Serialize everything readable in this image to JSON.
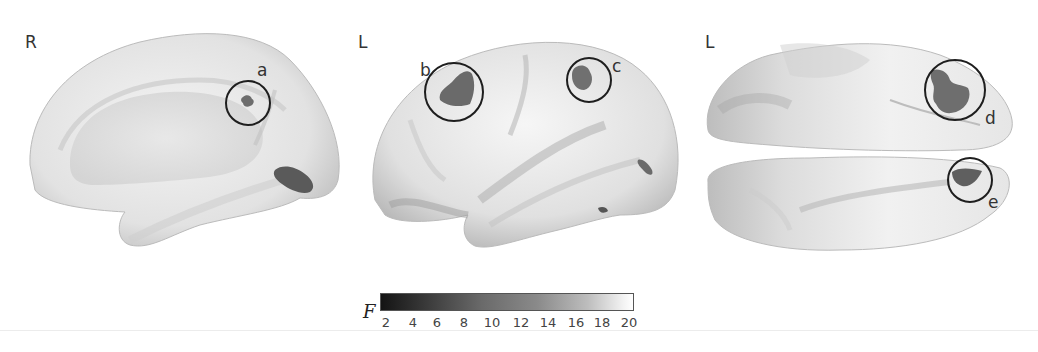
{
  "figure": {
    "panels": [
      {
        "view": "R",
        "description": "right hemisphere medial view",
        "regions": [
          {
            "label": "a"
          }
        ]
      },
      {
        "view": "L",
        "description": "left hemisphere lateral view",
        "regions": [
          {
            "label": "b"
          },
          {
            "label": "c"
          }
        ]
      },
      {
        "view": "L",
        "description": "ventral/dorsal view",
        "regions": [
          {
            "label": "d"
          },
          {
            "label": "e"
          }
        ]
      }
    ],
    "colorbar": {
      "label": "F",
      "min": 2,
      "max": 20,
      "ticks": [
        "2",
        "4",
        "6",
        "8",
        "10",
        "12",
        "14",
        "16",
        "18",
        "20"
      ],
      "colormap": "grayscale dark-to-light"
    }
  }
}
